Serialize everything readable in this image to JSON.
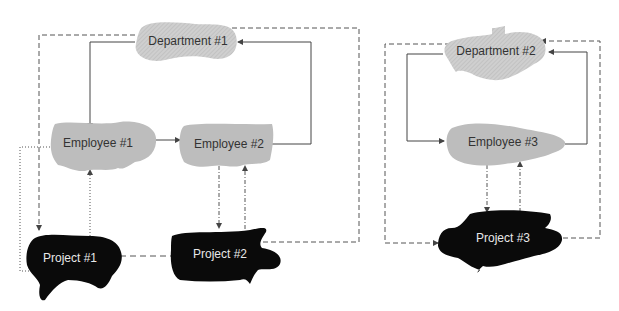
{
  "diagram": {
    "groups": [
      {
        "id": "group-1",
        "nodes": [
          {
            "id": "dept1",
            "label": "Department #1",
            "type": "department"
          },
          {
            "id": "emp1",
            "label": "Employee #1",
            "type": "employee"
          },
          {
            "id": "emp2",
            "label": "Employee #2",
            "type": "employee"
          },
          {
            "id": "proj1",
            "label": "Project #1",
            "type": "project"
          },
          {
            "id": "proj2",
            "label": "Project #2",
            "type": "project"
          }
        ]
      },
      {
        "id": "group-2",
        "nodes": [
          {
            "id": "dept2",
            "label": "Department #2",
            "type": "department"
          },
          {
            "id": "emp3",
            "label": "Employee #3",
            "type": "employee"
          },
          {
            "id": "proj3",
            "label": "Project #3",
            "type": "project"
          }
        ]
      }
    ],
    "edges": [
      {
        "from": "dept1",
        "to": "emp1",
        "style": "solid"
      },
      {
        "from": "emp1",
        "to": "emp2",
        "style": "solid"
      },
      {
        "from": "emp2",
        "to": "dept1",
        "style": "solid"
      },
      {
        "from": "dept1",
        "to": "proj1",
        "style": "dashed"
      },
      {
        "from": "proj2",
        "to": "dept1",
        "style": "dashed"
      },
      {
        "from": "proj1",
        "to": "proj2",
        "style": "dashed"
      },
      {
        "from": "emp1",
        "to": "proj1",
        "style": "dotted"
      },
      {
        "from": "proj1",
        "to": "emp1",
        "style": "dotted"
      },
      {
        "from": "emp2",
        "to": "proj2",
        "style": "dash-dot"
      },
      {
        "from": "proj2",
        "to": "emp2",
        "style": "dash-dot"
      },
      {
        "from": "dept2",
        "to": "emp3",
        "style": "solid"
      },
      {
        "from": "emp3",
        "to": "dept2",
        "style": "solid"
      },
      {
        "from": "dept2",
        "to": "proj3",
        "style": "dashed"
      },
      {
        "from": "proj3",
        "to": "dept2",
        "style": "dashed"
      },
      {
        "from": "emp3",
        "to": "proj3",
        "style": "dash-dot"
      },
      {
        "from": "proj3",
        "to": "emp3",
        "style": "dash-dot"
      }
    ],
    "colors": {
      "department_fill": "#c8c8c8",
      "employee_fill": "#bdbdbd",
      "project_fill": "#0a0a0a",
      "line": "#555555"
    }
  }
}
